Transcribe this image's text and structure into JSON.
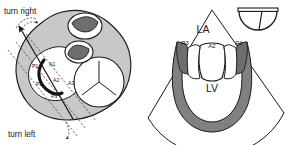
{
  "figure": {
    "colors": {
      "outline": "#1a1a1a",
      "body_fill": "#c8c8c8",
      "orifice_fill": "#ffffff",
      "leaflet_dark_fill": "#6e6e6e",
      "myocardium_fill": "#808080",
      "background": "#ffffff"
    }
  },
  "left_panel": {
    "name": "surgeons-view-heart-base",
    "annotations": {
      "turn_right": "turn right",
      "turn_left": "turn left"
    },
    "mitral_segments": [
      {
        "id": "A1",
        "label": "A1"
      },
      {
        "id": "A2",
        "label": "A2"
      },
      {
        "id": "A3",
        "label": "A3"
      },
      {
        "id": "P1",
        "label": "P1"
      },
      {
        "id": "P2",
        "label": "P2"
      },
      {
        "id": "P3",
        "label": "P3"
      }
    ],
    "valves": [
      {
        "id": "aortic",
        "leaflet_count": 3
      },
      {
        "id": "pulmonic",
        "leaflet_count": 3
      },
      {
        "id": "tricuspid",
        "leaflet_count": 3
      },
      {
        "id": "mitral",
        "leaflet_count": 2
      }
    ],
    "scan_planes": 3,
    "rotation_arrows": 2
  },
  "right_panel": {
    "name": "echo-sector-view",
    "chambers": [
      {
        "id": "LA",
        "label": "LA"
      },
      {
        "id": "LV",
        "label": "LV"
      }
    ],
    "leaflet_labels": [
      {
        "id": "P3",
        "label": "P3"
      },
      {
        "id": "A2",
        "label": "A2"
      },
      {
        "id": "P1",
        "label": "P1"
      }
    ],
    "transducer": {
      "label": "transducer-icon",
      "shape": "semicircle-with-index-marker"
    }
  }
}
